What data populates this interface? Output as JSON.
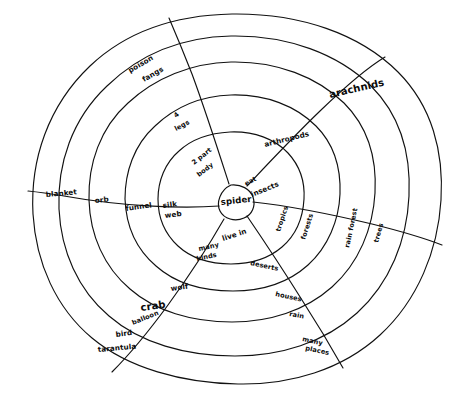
{
  "diagram": {
    "type": "radial-concept-map",
    "title_center": "spider",
    "ring_count": 5,
    "hub_label": "spider",
    "description_note": "hand-drawn concentric-oval concept web about spiders"
  },
  "branches": [
    {
      "name": "web",
      "direction": "west",
      "nodes": [
        "silk web",
        "funnel",
        "orb",
        "blanket"
      ]
    },
    {
      "name": "body",
      "direction": "north-northwest",
      "nodes": [
        "2 part body",
        "4 legs",
        "poison fangs"
      ]
    },
    {
      "name": "classification",
      "direction": "north-east",
      "nodes": [
        "eat insects",
        "arthropods",
        "arachnids"
      ]
    },
    {
      "name": "habitat",
      "direction": "east",
      "nodes": [
        "live in",
        "tropics",
        "forests",
        "rain forest",
        "trees"
      ]
    },
    {
      "name": "places",
      "direction": "south-east",
      "nodes": [
        "deserts",
        "houses",
        "rain",
        "many places"
      ]
    },
    {
      "name": "kinds",
      "direction": "south-west",
      "nodes": [
        "many kinds",
        "wolf",
        "crab",
        "balloon",
        "bird",
        "tarantula"
      ]
    }
  ],
  "labels": {
    "hub": "spider",
    "silk_web_line1": "silk",
    "silk_web_line2": "web",
    "funnel": "funnel",
    "orb": "orb",
    "blanket": "blanket",
    "two_part_line1": "2 part",
    "two_part_line2": "body",
    "four_legs_num": "4",
    "four_legs_word": "legs",
    "poison": "poison",
    "fangs": "fangs",
    "eat": "eat",
    "insects": "insects",
    "arthropods": "arthropods",
    "arachnids": "arachnids",
    "live_in": "live in",
    "tropics": "tropics",
    "forests": "forests",
    "rain_forest": "rain forest",
    "trees": "trees",
    "deserts": "deserts",
    "houses": "houses",
    "rain": "rain",
    "many_line1": "many",
    "many_line2": "places",
    "many_kinds_line1": "many",
    "many_kinds_line2": "kinds",
    "wolf": "wolf",
    "crab": "crab",
    "balloon": "balloon",
    "bird": "bird",
    "tarantula": "tarantula"
  },
  "colors": {
    "ink": "#111111",
    "paper": "#ffffff"
  }
}
